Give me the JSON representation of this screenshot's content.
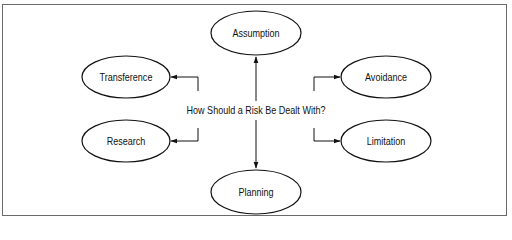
{
  "diagram": {
    "center": {
      "label": "How Should a Risk Be Dealt With?"
    },
    "nodes": [
      {
        "id": "assumption",
        "label": "Assumption",
        "cx": 256,
        "cy": 33,
        "rx": 45,
        "ry": 22
      },
      {
        "id": "transference",
        "label": "Transference",
        "cx": 126,
        "cy": 77,
        "rx": 44,
        "ry": 21
      },
      {
        "id": "avoidance",
        "label": "Avoidance",
        "cx": 386,
        "cy": 77,
        "rx": 45,
        "ry": 21
      },
      {
        "id": "research",
        "label": "Research",
        "cx": 126,
        "cy": 141,
        "rx": 44,
        "ry": 21
      },
      {
        "id": "limitation",
        "label": "Limitation",
        "cx": 386,
        "cy": 141,
        "rx": 45,
        "ry": 21
      },
      {
        "id": "planning",
        "label": "Planning",
        "cx": 256,
        "cy": 192,
        "rx": 45,
        "ry": 22
      }
    ],
    "edges": [
      {
        "from": "center",
        "to": "assumption",
        "direction": "up"
      },
      {
        "from": "center",
        "to": "transference",
        "direction": "up-left"
      },
      {
        "from": "center",
        "to": "avoidance",
        "direction": "up-right"
      },
      {
        "from": "center",
        "to": "research",
        "direction": "down-left"
      },
      {
        "from": "center",
        "to": "limitation",
        "direction": "down-right"
      },
      {
        "from": "center",
        "to": "planning",
        "direction": "down"
      }
    ],
    "colors": {
      "stroke": "#111111",
      "frame": "#6a6a6a",
      "background": "#ffffff"
    }
  }
}
